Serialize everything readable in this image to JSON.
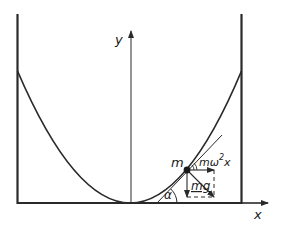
{
  "diagram": {
    "labels": {
      "y_axis": "y",
      "x_axis": "x",
      "mass": "m",
      "centrifugal_force": "mω",
      "centrifugal_exp": "2",
      "centrifugal_var": "x",
      "gravity_force": "mg",
      "angle": "α"
    },
    "colors": {
      "stroke": "#2a2a2a",
      "background": "#ffffff"
    }
  }
}
